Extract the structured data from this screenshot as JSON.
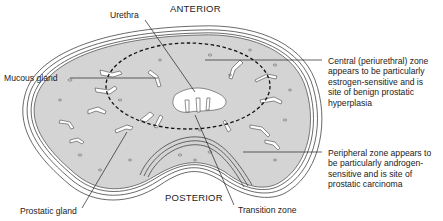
{
  "diagram": {
    "orientation": {
      "top": "ANTERIOR",
      "bottom": "POSTERIOR"
    },
    "labels": {
      "urethra": "Urethra",
      "mucous_gland": "Mucous gland",
      "prostatic_gland": "Prostatic gland",
      "transition_zone": "Transition zone",
      "central_zone": {
        "lines": [
          "Central (periurethral) zone",
          "appears to be particularly",
          "estrogen-sensitive and is",
          "site of benign prostatic",
          "hyperplasia"
        ]
      },
      "peripheral_zone": {
        "lines": [
          "Peripheral zone appears to",
          "be particularly androgen-",
          "sensitive and is site of",
          "prostatic carcinoma"
        ]
      }
    },
    "colors": {
      "tissue_fill": "#d4d4d4",
      "outline": "#333333",
      "gland_lumen": "#ffffff",
      "background": "#ffffff"
    }
  }
}
